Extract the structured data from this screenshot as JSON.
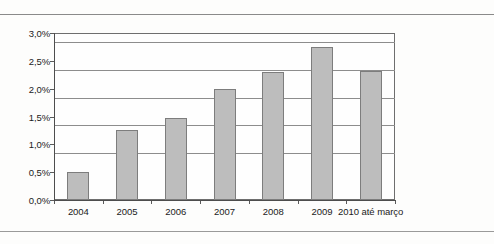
{
  "figure": {
    "background_color": "#fdfdfc",
    "bar_fill_color": "#bdbdbd",
    "bar_edge_color": "#7d7d7d",
    "gridline_color": "#8d8d8d",
    "axis_color": "#4d4d4d"
  },
  "chart_data": {
    "type": "bar",
    "title": "",
    "subtitle": "",
    "xlabel": "",
    "ylabel": "",
    "categories": [
      "2004",
      "2005",
      "2006",
      "2007",
      "2008",
      "2009",
      "2010 até março"
    ],
    "values": [
      0.5,
      1.25,
      1.47,
      2.0,
      2.3,
      2.75,
      2.32
    ],
    "ytick_labels": [
      "0,0%",
      "0,5%",
      "1,0%",
      "1,5%",
      "2,0%",
      "2,5%",
      "3,0%"
    ],
    "ytick_values": [
      0.0,
      0.5,
      1.0,
      1.5,
      2.0,
      2.5,
      3.0
    ],
    "ylim": [
      0,
      3.0
    ],
    "grid": true,
    "grid_axis": "y",
    "legend": null,
    "legend_position": "none",
    "annotations": []
  }
}
